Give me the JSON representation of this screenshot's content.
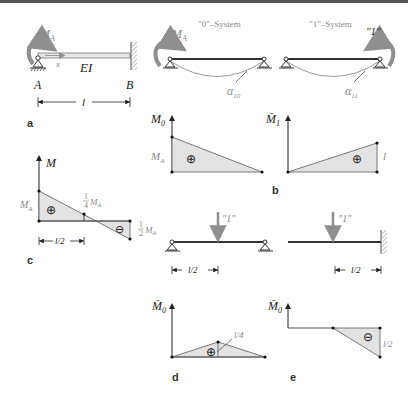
{
  "colors": {
    "top_bar": "#555555",
    "beam": "#333333",
    "area_fill": "#e3e3e3",
    "label_gray": "#8a8a8a",
    "curve": "#9a9a9a",
    "moment_arrow": "#8f8f8f"
  },
  "panel_a": {
    "label": "a",
    "moment": "M_A",
    "moment_base": "M",
    "moment_sub": "A",
    "coord": "x",
    "stiffness": "EI",
    "support_left": "A",
    "support_right": "B",
    "span": "l"
  },
  "panel_top_right": {
    "system0_title": "\"0\"–System",
    "system1_title": "\"1\"–System",
    "moment0": "M",
    "moment0_sub": "A",
    "moment1": "\"1\"",
    "angle0": "α",
    "angle0_sub": "10",
    "angle1": "α",
    "angle1_sub": "11"
  },
  "panel_b": {
    "label": "b",
    "diagram0_axis": "M",
    "diagram0_axis_sub": "0",
    "diagram0_value": "M",
    "diagram0_value_sub": "A",
    "diagram0_sign": "⊕",
    "diagram1_axis": "M̄",
    "diagram1_axis_sub": "1",
    "diagram1_value": "l",
    "diagram1_sign": "⊕"
  },
  "panel_c": {
    "label": "c",
    "axis": "M",
    "value_left": "M",
    "value_left_sub": "A",
    "value_mid_num": "1",
    "value_mid_den": "4",
    "value_mid": "M",
    "value_mid_sub": "A",
    "value_right_num": "1",
    "value_right_den": "2",
    "value_right": "M",
    "value_right_sub": "A",
    "sign_pos": "⊕",
    "sign_neg": "⊖",
    "dimension": "l/2"
  },
  "panel_load": {
    "load_left": "\"1\"",
    "load_right": "\"1\"",
    "dim_left": "l/2",
    "dim_right": "l/2"
  },
  "panel_d": {
    "label": "d",
    "axis": "M̄",
    "axis_sub": "0",
    "value": "l/4",
    "sign": "⊕"
  },
  "panel_e": {
    "label": "e",
    "axis": "M̄",
    "axis_sub": "0",
    "value": "l/2",
    "sign": "⊖"
  }
}
